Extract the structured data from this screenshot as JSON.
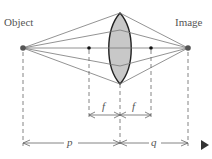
{
  "labels": {
    "object": "Object",
    "image": "Image",
    "focal_left": "f",
    "focal_right": "f",
    "object_distance": "p",
    "image_distance": "q"
  },
  "icons": {
    "next": "play-triangle-icon"
  },
  "colors": {
    "lens_fill": "#c8c8c8",
    "lens_stroke": "#222222",
    "ray": "#777777",
    "point": "#555555",
    "focal_point": "#111111",
    "nav_triangle": "#333333"
  }
}
